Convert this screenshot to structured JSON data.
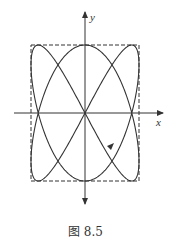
{
  "figure": {
    "caption": "图 8.5",
    "x_axis_label": "x",
    "y_axis_label": "y",
    "curve": {
      "type": "lissajous",
      "x_freq": 2,
      "y_freq": 3,
      "direction_arrow": "lower-right, pointing down-left"
    },
    "bounding_box": "dashed",
    "colors": {
      "stroke": "#333333",
      "background": "#ffffff"
    }
  }
}
